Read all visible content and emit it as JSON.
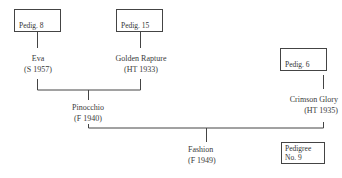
{
  "diagram": {
    "type": "pedigree-tree",
    "nodes": {
      "eva": {
        "name": "Eva",
        "detail": "(S 1957)"
      },
      "golden_rapture": {
        "name": "Golden Rapture",
        "detail": "(HT 1933)"
      },
      "pinocchio": {
        "name": "Pinocchio",
        "detail": "(F 1940)"
      },
      "crimson_glory": {
        "name": "Crimson Glory",
        "detail": "(HT 1935)"
      },
      "fashion": {
        "name": "Fashion",
        "detail": "(F 1949)"
      }
    },
    "references": {
      "eva": "Pedig. 8",
      "golden_rapture": "Pedig. 15",
      "crimson_glory": "Pedig. 6"
    },
    "pedigree_label": {
      "line1": "Pedigree",
      "line2": "No. 9"
    },
    "edges": [
      [
        "eva",
        "pinocchio"
      ],
      [
        "golden_rapture",
        "pinocchio"
      ],
      [
        "pinocchio",
        "fashion"
      ],
      [
        "crimson_glory",
        "fashion"
      ]
    ]
  }
}
